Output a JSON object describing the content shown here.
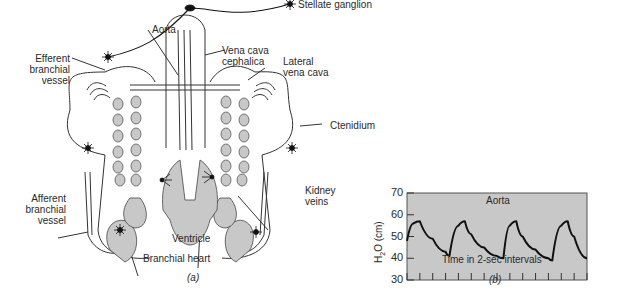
{
  "figure_a": {
    "caption": "(a)",
    "labels": {
      "aorta": "Aorta",
      "stellate_ganglion": "Stellate ganglion",
      "efferent_branchial_vessel": [
        "Efferent",
        "branchial",
        "vessel"
      ],
      "vena_cava_cephalica": [
        "Vena cava",
        "cephalica"
      ],
      "lateral_vena_cava": [
        "Lateral",
        "vena cava"
      ],
      "ctenidium": "Ctenidium",
      "afferent_branchial_vessel": [
        "Afferent",
        "branchial",
        "vessel"
      ],
      "kidney_veins": [
        "Kidney",
        "veins"
      ],
      "ventricle": "Ventricle",
      "branchial_heart": "Branchial heart"
    }
  },
  "figure_b": {
    "caption": "(b)"
  },
  "chart_data": {
    "type": "line",
    "title": "Aorta",
    "xlabel": "Time in 2-sec intervals",
    "ylabel": "H2O (cm)",
    "ylabel_parts": {
      "base": "H",
      "sub": "2",
      "rest": "O (cm)"
    },
    "yticks": [
      30,
      40,
      50,
      60,
      70
    ],
    "ylim": [
      30,
      70
    ],
    "x_tick_count": 14,
    "grid": false,
    "background": "#c8c8c8",
    "line_color": "#111111",
    "series": [
      {
        "name": "Aortic pressure",
        "x": [
          0,
          0.5,
          1,
          2,
          3,
          3.3,
          4,
          4.5,
          5,
          6,
          7,
          7.5,
          8,
          8.5,
          9,
          10,
          11,
          11.3,
          12,
          12.5,
          13,
          14
        ],
        "values": [
          48,
          56,
          57,
          49,
          43,
          41,
          55,
          57,
          51,
          45,
          41,
          40,
          55,
          57,
          50,
          44,
          40,
          39,
          55,
          57,
          50,
          40
        ]
      }
    ]
  }
}
